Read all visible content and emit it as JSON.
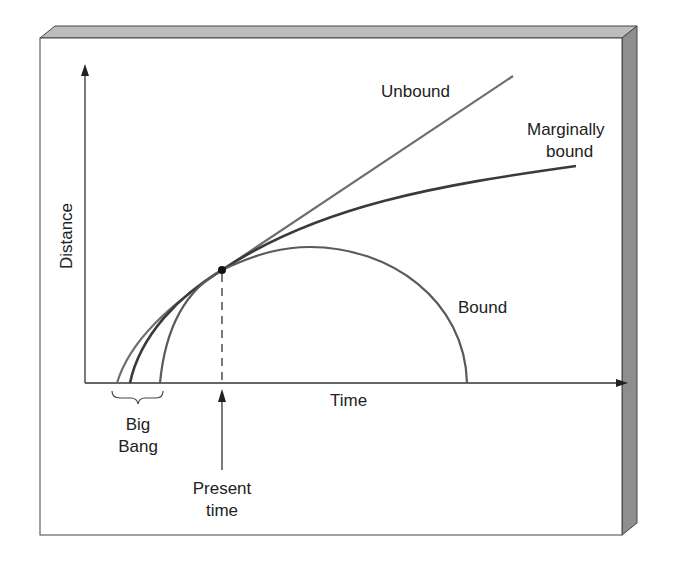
{
  "diagram": {
    "title": "",
    "axes": {
      "x_label": "Time",
      "y_label": "Distance"
    },
    "curves": [
      {
        "id": "unbound",
        "label": "Unbound"
      },
      {
        "id": "marginally-bound",
        "label_line1": "Marginally",
        "label_line2": "bound"
      },
      {
        "id": "bound",
        "label": "Bound"
      }
    ],
    "annotations": {
      "big_bang_line1": "Big",
      "big_bang_line2": "Bang",
      "present_line1": "Present",
      "present_line2": "time"
    },
    "colors": {
      "curve_unbound": "#6e6e6e",
      "curve_marginal": "#3a3a3a",
      "curve_bound": "#5a5a5a",
      "axis": "#333333",
      "frame_bevel": "#b8b8b8",
      "frame_side": "#8c8c8c",
      "background": "#ffffff"
    }
  }
}
